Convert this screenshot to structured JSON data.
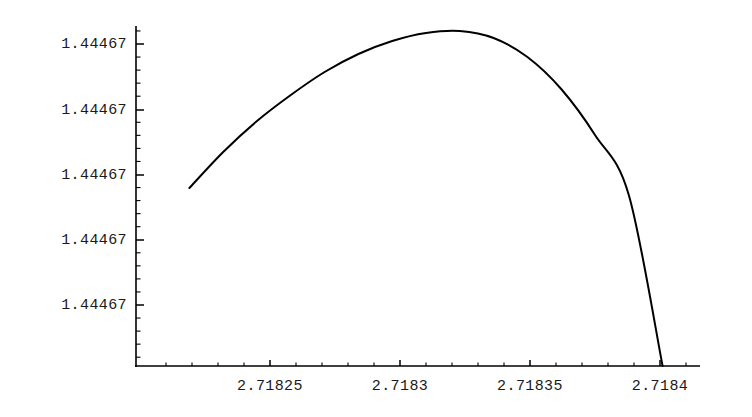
{
  "chart_data": {
    "type": "line",
    "title": "",
    "subtitle": "",
    "xlabel": "",
    "ylabel": "",
    "grid": false,
    "legend": null,
    "legend_position": "none",
    "note": "Mathematica-style plot of a very narrow x-range near e; all y tick labels print identically as 1.44467 due to display precision truncation.",
    "xlim": [
      2.718219,
      2.718404
    ],
    "ylim": [
      1.4446699,
      1.4446707
    ],
    "x_tick_labels": [
      "2.71825",
      "2.7183",
      "2.71835",
      "2.7184"
    ],
    "x_tick_values": [
      2.71825,
      2.7183,
      2.71835,
      2.7184
    ],
    "y_tick_labels": [
      "1.44467",
      "1.44467",
      "1.44467",
      "1.44467",
      "1.44467"
    ],
    "minor_ticks_per_interval": 4,
    "series": [
      {
        "name": "curve",
        "color": "#000000",
        "x": [
          2.718219,
          2.718232,
          2.718245,
          2.718258,
          2.718271,
          2.718284,
          2.718297,
          2.71831,
          2.718323,
          2.718336,
          2.718349,
          2.718362,
          2.718375,
          2.718388,
          2.718401
        ],
        "y_pixel": [
          188,
          152,
          121,
          95,
          72,
          54,
          41,
          33,
          31,
          38,
          57,
          89,
          135,
          195,
          366
        ],
        "peak_x": 2.718297,
        "peak_label": "maximum near x = 2.7183"
      }
    ]
  },
  "axes": {
    "origin_px": {
      "x": 136,
      "y": 366
    },
    "x_axis_end_px": 700,
    "y_axis_top_px": 26,
    "y_tick_positions_px": [
      44,
      110,
      175,
      240,
      305
    ],
    "x_tick_positions_px": [
      270,
      400,
      530,
      660
    ],
    "axis_color": "#000000",
    "curve_color": "#000000",
    "background": "#ffffff"
  }
}
